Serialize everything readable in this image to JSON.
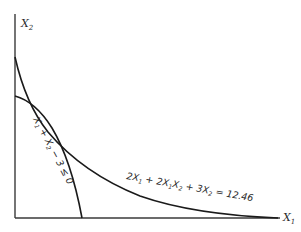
{
  "diagram": {
    "axes": {
      "x_label": "X",
      "x_sub": "1",
      "y_label": "X",
      "y_sub": "2"
    },
    "curves": [
      {
        "name": "objective-contour",
        "equation": "2X1 + 2X1X2 + 3X2 = 12.46",
        "label_parts": {
          "t1": "2X",
          "s1": "1",
          "t2": " + 2X",
          "s2": "1",
          "t3": "X",
          "s3": "2",
          "t4": " + 3X",
          "s4": "2",
          "t5": " = 12.46"
        }
      },
      {
        "name": "constraint-boundary",
        "equation": "X1 + X2 - 3 ≤ 0",
        "label_parts": {
          "t1": "X",
          "s1": "1",
          "t2": " + X",
          "s2": "2",
          "t3": " − 3 ≤ 0"
        }
      }
    ],
    "colors": {
      "line": "#1a1a1a",
      "axis": "#3a3a3a",
      "text": "#2a2a2a"
    }
  }
}
